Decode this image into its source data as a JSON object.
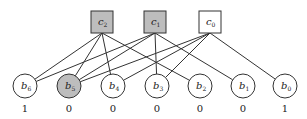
{
  "colors": {
    "shaded": "#bdbdbd",
    "plain": "#ffffff",
    "stroke": "#333333"
  },
  "check_nodes": [
    {
      "id": "c2",
      "base": "c",
      "sub": "2",
      "x": 102,
      "shaded": true
    },
    {
      "id": "c1",
      "base": "c",
      "sub": "1",
      "x": 155,
      "shaded": true
    },
    {
      "id": "c0",
      "base": "c",
      "sub": "0",
      "x": 210,
      "shaded": false
    }
  ],
  "bit_nodes": [
    {
      "id": "b6",
      "base": "b",
      "sub": "6",
      "x": 25,
      "value": "1",
      "shaded": false
    },
    {
      "id": "b5",
      "base": "b",
      "sub": "5",
      "x": 69,
      "value": "0",
      "shaded": true
    },
    {
      "id": "b4",
      "base": "b",
      "sub": "4",
      "x": 113,
      "value": "0",
      "shaded": false
    },
    {
      "id": "b3",
      "base": "b",
      "sub": "3",
      "x": 157,
      "value": "0",
      "shaded": false
    },
    {
      "id": "b2",
      "base": "b",
      "sub": "2",
      "x": 200,
      "value": "0",
      "shaded": false
    },
    {
      "id": "b1",
      "base": "b",
      "sub": "1",
      "x": 243,
      "value": "0",
      "shaded": false
    },
    {
      "id": "b0",
      "base": "b",
      "sub": "0",
      "x": 285,
      "value": "1",
      "shaded": false
    }
  ],
  "edges": [
    [
      "c2",
      "b6"
    ],
    [
      "c2",
      "b5"
    ],
    [
      "c2",
      "b4"
    ],
    [
      "c2",
      "b2"
    ],
    [
      "c1",
      "b6"
    ],
    [
      "c1",
      "b5"
    ],
    [
      "c1",
      "b3"
    ],
    [
      "c1",
      "b1"
    ],
    [
      "c0",
      "b5"
    ],
    [
      "c0",
      "b4"
    ],
    [
      "c0",
      "b3"
    ],
    [
      "c0",
      "b0"
    ]
  ]
}
